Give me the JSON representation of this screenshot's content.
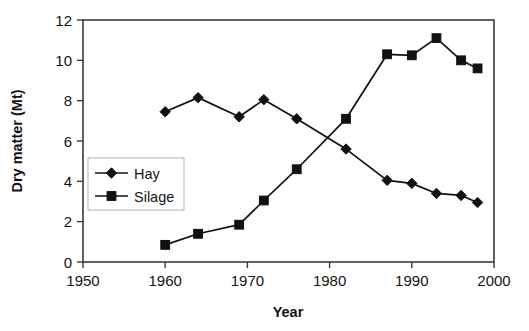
{
  "chart_data": {
    "type": "line",
    "title": "",
    "xlabel": "Year",
    "ylabel": "Dry matter (Mt)",
    "xlim": [
      1950,
      2000
    ],
    "ylim": [
      0,
      12
    ],
    "xticks": [
      1950,
      1960,
      1970,
      1980,
      1990,
      2000
    ],
    "xtick_labels": [
      "1950",
      "1960",
      "1970",
      "1980",
      "1990",
      "2000"
    ],
    "yticks": [
      0,
      2,
      4,
      6,
      8,
      10,
      12
    ],
    "ytick_labels": [
      "0",
      "2",
      "4",
      "6",
      "8",
      "10",
      "12"
    ],
    "grid": false,
    "legend_position": "center-left inside plot",
    "series": [
      {
        "name": "Hay",
        "marker": "diamond",
        "color": "#111111",
        "x": [
          1960,
          1964,
          1969,
          1972,
          1976,
          1982,
          1987,
          1990,
          1993,
          1996,
          1998
        ],
        "values": [
          7.45,
          8.15,
          7.2,
          8.05,
          7.1,
          5.6,
          4.05,
          3.9,
          3.4,
          3.3,
          2.95
        ]
      },
      {
        "name": "Silage",
        "marker": "square",
        "color": "#111111",
        "x": [
          1960,
          1964,
          1969,
          1972,
          1976,
          1982,
          1987,
          1990,
          1993,
          1996,
          1998
        ],
        "values": [
          0.85,
          1.4,
          1.85,
          3.05,
          4.6,
          7.1,
          10.3,
          10.25,
          11.1,
          10.0,
          9.6
        ]
      }
    ]
  },
  "legend": {
    "entries": [
      {
        "label": "Hay",
        "marker": "diamond"
      },
      {
        "label": "Silage",
        "marker": "square"
      }
    ]
  }
}
